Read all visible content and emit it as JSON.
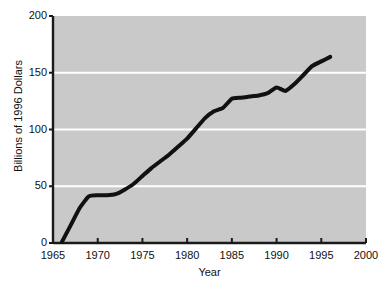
{
  "chart_data": {
    "type": "line",
    "title": "",
    "xlabel": "Year",
    "ylabel": "Billions of 1996 Dollars",
    "xlim": [
      1965,
      2000
    ],
    "ylim": [
      0,
      200
    ],
    "xticks": [
      1965,
      1970,
      1975,
      1980,
      1985,
      1990,
      1995,
      2000
    ],
    "yticks": [
      0,
      50,
      100,
      150,
      200
    ],
    "xtick_labels": [
      "1965",
      "1970",
      "1975",
      "1980",
      "1985",
      "1990",
      "1995",
      "2000"
    ],
    "ytick_labels": [
      "0",
      "50",
      "100",
      "150",
      "200"
    ],
    "grid": "horizontal-white-gridlines-at-50-100-150",
    "legend": "none",
    "plot_background_color": "#c9c9c9",
    "gridline_color": "#ffffff",
    "line_color": "#111111",
    "line_width_px": 4,
    "axis_color": "#1a1a1a",
    "series": [
      {
        "name": "Spending",
        "x": [
          1966,
          1967,
          1968,
          1969,
          1970,
          1971,
          1972,
          1973,
          1974,
          1975,
          1976,
          1977,
          1978,
          1979,
          1980,
          1981,
          1982,
          1983,
          1984,
          1985,
          1986,
          1987,
          1988,
          1989,
          1990,
          1991,
          1992,
          1993,
          1994,
          1995,
          1996
        ],
        "y": [
          1,
          16,
          31,
          41,
          42,
          42,
          43,
          47,
          52,
          59,
          66,
          72,
          78,
          85,
          92,
          101,
          110,
          116,
          119,
          127,
          128,
          129,
          130,
          132,
          137,
          134,
          140,
          148,
          156,
          160,
          164
        ]
      }
    ]
  },
  "axes": {
    "y_title": "Billions of 1996 Dollars",
    "x_title": "Year"
  }
}
